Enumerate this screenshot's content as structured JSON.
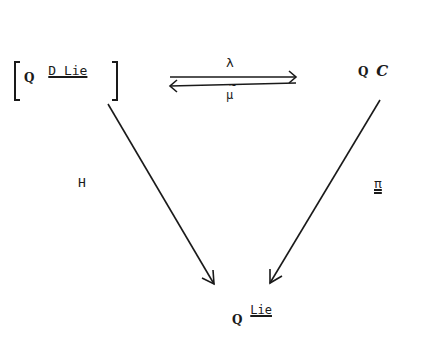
{
  "diagram": {
    "type": "commutative-triangle",
    "nodes": {
      "top_left": {
        "prefix": "Q",
        "label": "D Lie",
        "bracketed": true
      },
      "top_right": {
        "prefix": "Q",
        "label": "C"
      },
      "bottom": {
        "prefix": "Q",
        "superscript": "Lie"
      }
    },
    "arrows": {
      "top_forward": {
        "label": "λ",
        "from": "top_left",
        "to": "top_right"
      },
      "iso_mark": "~",
      "top_backward": {
        "label": "μ",
        "from": "top_right",
        "to": "top_left"
      },
      "left_diag": {
        "label": "H",
        "from": "top_left",
        "to": "bottom"
      },
      "right_diag": {
        "label": "π",
        "from": "top_right",
        "to": "bottom"
      }
    },
    "stroke_color": "#1a1a1a"
  }
}
